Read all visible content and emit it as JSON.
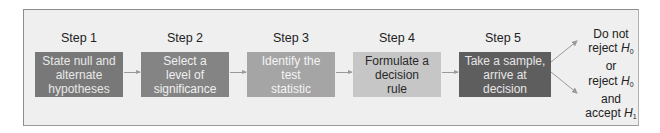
{
  "diagram": {
    "type": "flowchart",
    "steps": [
      {
        "label": "Step 1",
        "text": "State null and\nalternate\nhypotheses",
        "fill": "#787878",
        "text_color": "#e8e8e8"
      },
      {
        "label": "Step 2",
        "text": "Select a\nlevel of\nsignificance",
        "fill": "#848484",
        "text_color": "#f0f0f0"
      },
      {
        "label": "Step 3",
        "text": "Identify the\ntest\nstatistic",
        "fill": "#a5a5a5",
        "text_color": "#f4f4f4"
      },
      {
        "label": "Step 4",
        "text": "Formulate a\ndecision\nrule",
        "fill": "#c6c6c6",
        "text_color": "#2a2a2a"
      },
      {
        "label": "Step 5",
        "text": "Take a sample,\narrive at\ndecision",
        "fill": "#5e5e5e",
        "text_color": "#e6e6e6"
      }
    ],
    "outcome": {
      "line1": "Do not",
      "line2_prefix": "reject ",
      "line2_var": "H",
      "line2_sub": "0",
      "line3": "or",
      "line4_prefix": "reject ",
      "line4_var": "H",
      "line4_sub": "0",
      "line5": "and",
      "line6_prefix": "accept ",
      "line6_var": "H",
      "line6_sub": "1"
    }
  }
}
